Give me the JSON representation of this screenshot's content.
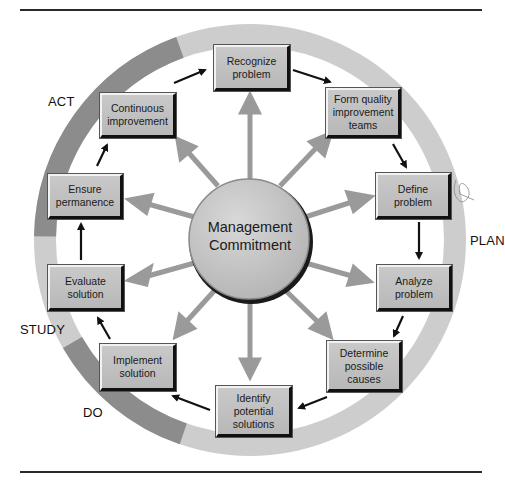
{
  "diagram": {
    "center": {
      "label": "Management\nCommitment"
    },
    "phases": [
      {
        "id": "act",
        "label": "ACT"
      },
      {
        "id": "plan",
        "label": "PLAN"
      },
      {
        "id": "study",
        "label": "STUDY"
      },
      {
        "id": "do",
        "label": "DO"
      }
    ],
    "steps": [
      {
        "id": "recognize",
        "label": "Recognize\nproblem"
      },
      {
        "id": "form-teams",
        "label": "Form quality\nimprovement\nteams"
      },
      {
        "id": "define",
        "label": "Define\nproblem"
      },
      {
        "id": "analyze",
        "label": "Analyze\nproblem"
      },
      {
        "id": "determine",
        "label": "Determine\npossible\ncauses"
      },
      {
        "id": "identify",
        "label": "Identify\npotential\nsolutions"
      },
      {
        "id": "implement",
        "label": "Implement\nsolution"
      },
      {
        "id": "evaluate",
        "label": "Evaluate\nsolution"
      },
      {
        "id": "ensure",
        "label": "Ensure\npermanence"
      },
      {
        "id": "continuous",
        "label": "Continuous\nimprovement"
      }
    ],
    "colors": {
      "ring_light": "#cdcdcd",
      "ring_dark": "#8c8c8c",
      "box_fill": "#c2c2c2",
      "spoke": "#9a9a9a",
      "flow_arrow": "#111111",
      "hub_fill": "#c6c6c6"
    }
  }
}
